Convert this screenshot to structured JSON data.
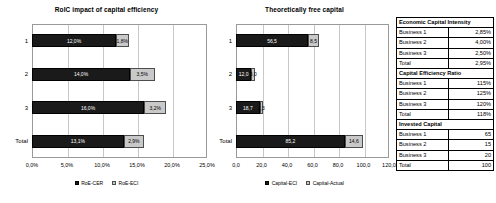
{
  "chart_data": [
    {
      "type": "bar",
      "title": "RoIC impact of capital efficiency",
      "orientation": "horizontal",
      "stacked": true,
      "categories": [
        "1",
        "2",
        "3",
        "Total"
      ],
      "series": [
        {
          "name": "RoE-CER",
          "values": [
            12.0,
            14.0,
            16.0,
            13.1
          ],
          "color": "#1a1a1a",
          "labels": [
            "12,0%",
            "14,0%",
            "16,0%",
            "13,1%"
          ]
        },
        {
          "name": "RoE-ECI",
          "values": [
            1.8,
            3.5,
            3.2,
            2.9
          ],
          "color": "#c9c9c9",
          "labels": [
            "1,8%",
            "3,5%",
            "3,2%",
            "2,9%"
          ]
        }
      ],
      "xlabel": "",
      "ylabel": "",
      "xlim": [
        0,
        25
      ],
      "xticks": [
        "0,0%",
        "5,0%",
        "10,0%",
        "15,0%",
        "20,0%",
        "25,0%"
      ],
      "grid": true,
      "legend_position": "bottom"
    },
    {
      "type": "bar",
      "title": "Theoretically free capital",
      "orientation": "horizontal",
      "stacked": true,
      "categories": [
        "1",
        "2",
        "3",
        "Total"
      ],
      "series": [
        {
          "name": "Capital-ECI",
          "values": [
            56.5,
            12.0,
            18.7,
            85.2
          ],
          "color": "#1a1a1a",
          "labels": [
            "56,5",
            "12,0",
            "18,7",
            "85,2"
          ]
        },
        {
          "name": "Capital-Actual",
          "values": [
            8.5,
            3.0,
            2.3,
            14.6
          ],
          "color": "#c9c9c9",
          "labels": [
            "8,5",
            "3,0",
            "2,3",
            "14,6"
          ]
        }
      ],
      "xlabel": "",
      "ylabel": "",
      "xlim": [
        0,
        120
      ],
      "xticks": [
        "0,0",
        "20,0",
        "40,0",
        "60,0",
        "80,0",
        "100,0",
        "120,0"
      ],
      "grid": true,
      "legend_position": "bottom"
    }
  ],
  "table": {
    "sections": [
      {
        "header": "Economic Capital Intensity",
        "rows": [
          {
            "label": "Business 1",
            "value": "2,85%"
          },
          {
            "label": "Business 2",
            "value": "4,00%"
          },
          {
            "label": "Business 3",
            "value": "2,50%"
          },
          {
            "label": "Total",
            "value": "2,95%"
          }
        ]
      },
      {
        "header": "Capital Efficiency Ratio",
        "rows": [
          {
            "label": "Business 1",
            "value": "115%"
          },
          {
            "label": "Business 2",
            "value": "125%"
          },
          {
            "label": "Business 3",
            "value": "120%"
          },
          {
            "label": "Total",
            "value": "118%"
          }
        ]
      },
      {
        "header": "Invested Capital",
        "rows": [
          {
            "label": "Business 1",
            "value": "65"
          },
          {
            "label": "Business 2",
            "value": "15"
          },
          {
            "label": "Business 3",
            "value": "20"
          },
          {
            "label": "Total",
            "value": "100"
          }
        ]
      }
    ]
  }
}
